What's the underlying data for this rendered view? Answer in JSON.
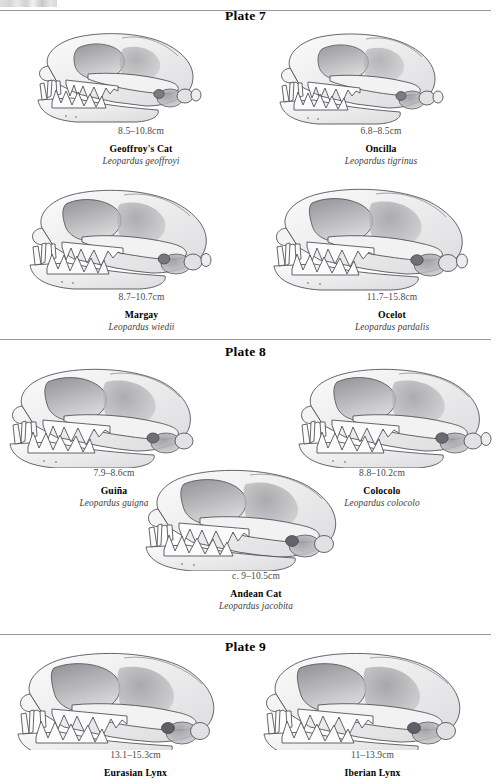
{
  "page": {
    "background_color": "#ffffff",
    "rule_color": "#9a9a9a",
    "measure_text_color": "#4a4a4a",
    "scientific_name_color": "#3c3c3c"
  },
  "sections": [
    {
      "heading": "Plate 7",
      "specimens": [
        {
          "measurement": "8.5–10.8cm",
          "common_name": "Geoffroy's Cat",
          "scientific_name": "Leopardus geoffroyi",
          "icon": "cat-skull-lateral-icon"
        },
        {
          "measurement": "6.8–8.5cm",
          "common_name": "Oncilla",
          "scientific_name": "Leopardus tigrinus",
          "icon": "cat-skull-lateral-icon"
        },
        {
          "measurement": "8.7–10.7cm",
          "common_name": "Margay",
          "scientific_name": "Leopardus wiedii",
          "icon": "cat-skull-lateral-icon"
        },
        {
          "measurement": "11.7–15.8cm",
          "common_name": "Ocelot",
          "scientific_name": "Leopardus pardalis",
          "icon": "cat-skull-lateral-icon"
        }
      ]
    },
    {
      "heading": "Plate 8",
      "specimens": [
        {
          "measurement": "7.9–8.6cm",
          "common_name": "Guiña",
          "scientific_name": "Leopardus guigna",
          "icon": "cat-skull-lateral-icon"
        },
        {
          "measurement": "8.8–10.2cm",
          "common_name": "Colocolo",
          "scientific_name": "Leopardus colocolo",
          "icon": "cat-skull-lateral-icon"
        },
        {
          "measurement": "c. 9–10.5cm",
          "common_name": "Andean Cat",
          "scientific_name": "Leopardus jacobita",
          "icon": "cat-skull-lateral-icon"
        }
      ]
    },
    {
      "heading": "Plate 9",
      "specimens": [
        {
          "measurement": "13.1–15.3cm",
          "common_name": "Eurasian Lynx",
          "scientific_name": "",
          "icon": "cat-skull-lateral-icon"
        },
        {
          "measurement": "11–13.9cm",
          "common_name": "Iberian Lynx",
          "scientific_name": "",
          "icon": "cat-skull-lateral-icon"
        }
      ]
    }
  ]
}
